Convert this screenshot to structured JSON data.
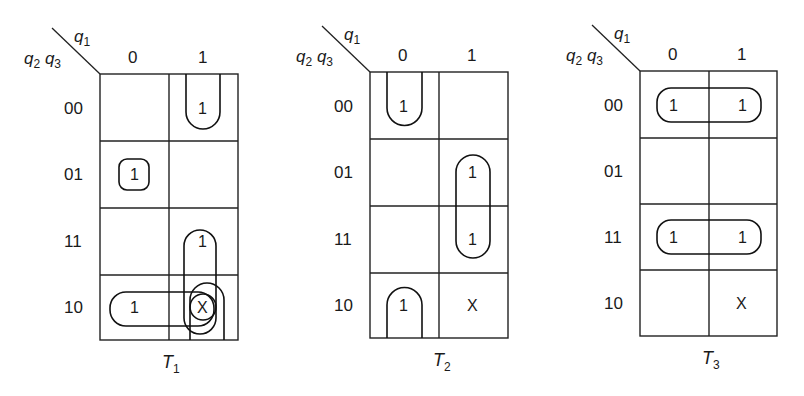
{
  "diagram": {
    "type": "karnaugh-maps",
    "row_var_label": "q2 q3",
    "col_var_label": "q1",
    "col_headers": [
      "0",
      "1"
    ],
    "row_headers": [
      "00",
      "01",
      "11",
      "10"
    ],
    "maps": [
      {
        "title": "T",
        "title_sub": "1",
        "cells": [
          [
            "",
            "1"
          ],
          [
            "1",
            ""
          ],
          [
            "",
            "1"
          ],
          [
            "1",
            "X"
          ]
        ]
      },
      {
        "title": "T",
        "title_sub": "2",
        "cells": [
          [
            "1",
            ""
          ],
          [
            "",
            "1"
          ],
          [
            "",
            "1"
          ],
          [
            "1",
            "X"
          ]
        ]
      },
      {
        "title": "T",
        "title_sub": "3",
        "cells": [
          [
            "1",
            "1"
          ],
          [
            "",
            ""
          ],
          [
            "1",
            "1"
          ],
          [
            "",
            "X"
          ]
        ]
      }
    ],
    "groupings": {
      "T1": [
        "q1=1,q2q3=00 wraps with q1=1,q2q3=10 (X)",
        "single 1 at q1=0,q2q3=01",
        "q1=1 rows 11-10 (1,X)",
        "row 10 pair (1,X)"
      ],
      "T2": [
        "q1=0 rows 00 and 10 wrap-around",
        "q1=1 rows 01-11"
      ],
      "T3": [
        "row 00 pair",
        "row 11 pair"
      ]
    }
  }
}
